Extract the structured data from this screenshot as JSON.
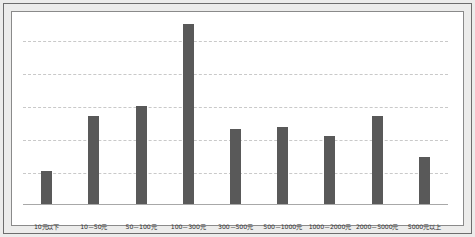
{
  "chart_data": {
    "type": "bar",
    "title": "",
    "subtitle": "",
    "xlabel": "",
    "ylabel": "",
    "legend": [],
    "grid": true,
    "gridlines": 5,
    "ylim": [
      0,
      100
    ],
    "bar_color": "#595959",
    "gridline_color": "#c9c9c9",
    "axis_color": "#a8a8a8",
    "categories": [
      "10元以下",
      "10－50元",
      "50－100元",
      "100－300元",
      "300－500元",
      "500－1000元",
      "1000－2000元",
      "2000－5000元",
      "5000元以上"
    ],
    "values": [
      17.5,
      47,
      52,
      96,
      40,
      41,
      36,
      47,
      25
    ]
  },
  "frame": {
    "paper_color": "#ececeb",
    "panel_color": "#ffffff",
    "border_color": "#6d6d6d"
  }
}
